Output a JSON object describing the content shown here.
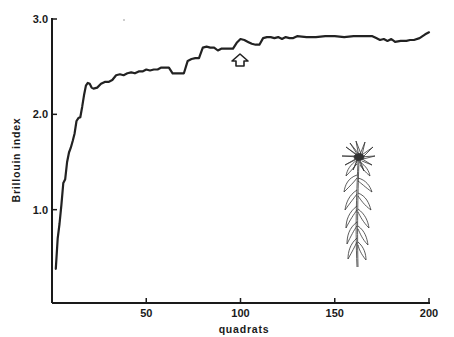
{
  "chart_data": {
    "type": "line",
    "title": "",
    "xlabel": "quadrats",
    "ylabel": "Brillouin index",
    "xlim": [
      0,
      200
    ],
    "ylim": [
      0,
      3.0
    ],
    "x_ticks": [
      50,
      100,
      150,
      200
    ],
    "x_tick_labels": [
      "50",
      "100",
      "150",
      "200"
    ],
    "y_ticks": [
      1.0,
      2.0,
      3.0
    ],
    "y_tick_labels": [
      "1.0",
      "2.0",
      "3.0"
    ],
    "grid": false,
    "legend": null,
    "annotations": [
      {
        "type": "arrow-up",
        "x": 100,
        "y": 2.62,
        "note": "hollow upward arrow marking point near quadrat 100"
      },
      {
        "type": "illustration",
        "description": "line drawing of a flowering plant (daisy-like flower head on leafy stem)"
      }
    ],
    "series": [
      {
        "name": "Brillouin index",
        "x": [
          2,
          3,
          4,
          5,
          6,
          7,
          8,
          9,
          10,
          11,
          12,
          13,
          14,
          15,
          16,
          17,
          18,
          19,
          20,
          21,
          22,
          24,
          26,
          28,
          30,
          32,
          34,
          36,
          38,
          40,
          42,
          44,
          46,
          48,
          50,
          52,
          54,
          56,
          58,
          60,
          62,
          64,
          66,
          68,
          70,
          72,
          74,
          76,
          78,
          80,
          82,
          84,
          86,
          88,
          90,
          92,
          94,
          96,
          98,
          100,
          102,
          104,
          106,
          108,
          110,
          112,
          114,
          116,
          118,
          120,
          122,
          124,
          126,
          128,
          130,
          135,
          140,
          145,
          150,
          155,
          160,
          165,
          170,
          172,
          174,
          176,
          178,
          180,
          182,
          185,
          188,
          190,
          192,
          195,
          198,
          200
        ],
        "values": [
          0.38,
          0.7,
          0.85,
          1.05,
          1.28,
          1.32,
          1.5,
          1.6,
          1.65,
          1.72,
          1.8,
          1.93,
          1.96,
          1.97,
          2.08,
          2.2,
          2.3,
          2.33,
          2.32,
          2.28,
          2.27,
          2.28,
          2.32,
          2.34,
          2.34,
          2.36,
          2.41,
          2.42,
          2.41,
          2.43,
          2.44,
          2.43,
          2.45,
          2.45,
          2.47,
          2.46,
          2.47,
          2.47,
          2.49,
          2.49,
          2.49,
          2.43,
          2.43,
          2.43,
          2.43,
          2.56,
          2.58,
          2.59,
          2.59,
          2.7,
          2.71,
          2.7,
          2.7,
          2.67,
          2.69,
          2.69,
          2.69,
          2.69,
          2.75,
          2.79,
          2.78,
          2.76,
          2.74,
          2.73,
          2.73,
          2.8,
          2.81,
          2.81,
          2.8,
          2.81,
          2.79,
          2.81,
          2.8,
          2.8,
          2.82,
          2.81,
          2.81,
          2.82,
          2.82,
          2.81,
          2.82,
          2.82,
          2.82,
          2.8,
          2.78,
          2.79,
          2.77,
          2.79,
          2.76,
          2.77,
          2.77,
          2.78,
          2.78,
          2.8,
          2.84,
          2.86
        ]
      }
    ]
  }
}
